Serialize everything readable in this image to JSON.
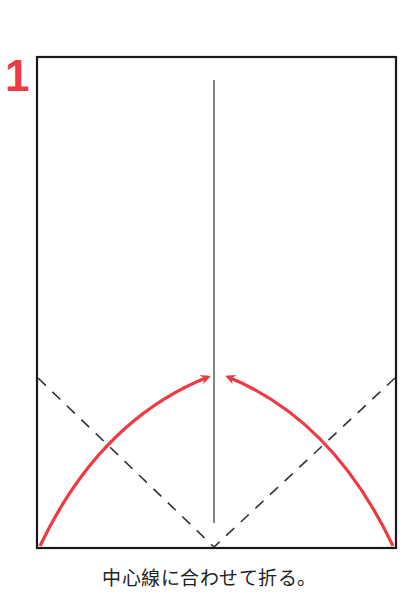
{
  "step": {
    "number": "1",
    "caption": "中心線に合わせて折る。"
  },
  "diagram": {
    "paper": {
      "x": 37,
      "y": 57,
      "width": 359,
      "height": 491,
      "stroke": "#1a1a1a"
    },
    "center_line": {
      "x": 214,
      "y1": 80,
      "y2": 523,
      "stroke": "#333333"
    },
    "fold_lines": [
      {
        "x1": 37,
        "y1": 378,
        "x2": 214,
        "y2": 548,
        "style": "dashed"
      },
      {
        "x1": 396,
        "y1": 378,
        "x2": 214,
        "y2": 548,
        "style": "dashed"
      }
    ],
    "arrows": [
      {
        "from": [
          40,
          546
        ],
        "to": [
          210,
          376
        ],
        "direction": "left-to-center"
      },
      {
        "from": [
          393,
          546
        ],
        "to": [
          226,
          376
        ],
        "direction": "right-to-center"
      }
    ],
    "colors": {
      "accent": "#ee3a45",
      "line": "#1a1a1a"
    }
  }
}
